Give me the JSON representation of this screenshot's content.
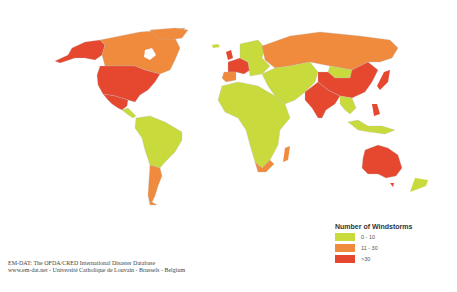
{
  "map": {
    "title": "Number of Windstorms",
    "colors": {
      "low": "#c9da3c",
      "mid": "#f08a3c",
      "high": "#e5472f",
      "water": "#ffffff"
    },
    "regions": [
      {
        "name": "Alaska/Western USA",
        "category": "high"
      },
      {
        "name": "Canada",
        "category": "mid"
      },
      {
        "name": "United States",
        "category": "high"
      },
      {
        "name": "Mexico",
        "category": "high"
      },
      {
        "name": "Central America",
        "category": "low"
      },
      {
        "name": "South America",
        "category": "low"
      },
      {
        "name": "Argentina",
        "category": "mid"
      },
      {
        "name": "Greenland",
        "category": "mid"
      },
      {
        "name": "Western Europe",
        "category": "high"
      },
      {
        "name": "Northern/Eastern Europe",
        "category": "low"
      },
      {
        "name": "Russia",
        "category": "mid"
      },
      {
        "name": "Africa",
        "category": "low"
      },
      {
        "name": "South Africa",
        "category": "mid"
      },
      {
        "name": "Madagascar",
        "category": "mid"
      },
      {
        "name": "Middle East/Central Asia",
        "category": "low"
      },
      {
        "name": "India/South Asia",
        "category": "high"
      },
      {
        "name": "China",
        "category": "high"
      },
      {
        "name": "Mongolia",
        "category": "low"
      },
      {
        "name": "Japan",
        "category": "high"
      },
      {
        "name": "Philippines",
        "category": "high"
      },
      {
        "name": "Southeast Asia/Indonesia",
        "category": "low"
      },
      {
        "name": "Australia",
        "category": "high"
      },
      {
        "name": "New Zealand",
        "category": "low"
      }
    ]
  },
  "legend": {
    "title": "Number of Windstorms",
    "items": [
      {
        "label": "0 - 10",
        "color": "#c9da3c"
      },
      {
        "label": "11 - 30",
        "color": "#f08a3c"
      },
      {
        "label": ">30",
        "color": "#e5472f"
      }
    ]
  },
  "credit": {
    "line1": "EM-DAT: The OFDA/CRED International Disaster Database",
    "line2": "www.em-dat.net - Université Catholique de Louvain - Brussels - Belgium"
  }
}
